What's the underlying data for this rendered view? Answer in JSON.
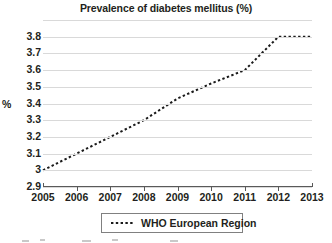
{
  "chart_data": {
    "type": "line",
    "title": "Prevalence of diabetes mellitus (%)",
    "xlabel": "",
    "ylabel": "%",
    "x": [
      2005,
      2006,
      2007,
      2008,
      2009,
      2010,
      2011,
      2012,
      2013
    ],
    "xticklabels": [
      "2005",
      "2006",
      "2007",
      "2008",
      "2009",
      "2010",
      "2011",
      "2012",
      "2013"
    ],
    "yticklabels": [
      "2.9",
      "3",
      "3.1",
      "3.2",
      "3.3",
      "3.4",
      "3.5",
      "3.6",
      "3.7",
      "3.8"
    ],
    "ytickvalues": [
      2.9,
      3.0,
      3.1,
      3.2,
      3.3,
      3.4,
      3.5,
      3.6,
      3.7,
      3.8
    ],
    "ylim": [
      2.9,
      3.9
    ],
    "xlim": [
      2005,
      2013
    ],
    "grid": "horizontal",
    "legend_position": "bottom-center",
    "line_style": "dotted",
    "line_color": "#1a1a1a",
    "grid_color": "#d9d9d9",
    "series": [
      {
        "name": "WHO European Region",
        "values": [
          3.0,
          3.1,
          3.2,
          3.3,
          3.43,
          3.52,
          3.6,
          3.8,
          3.8
        ]
      }
    ]
  },
  "legend": {
    "entries": [
      {
        "label": "WHO European Region"
      }
    ]
  }
}
